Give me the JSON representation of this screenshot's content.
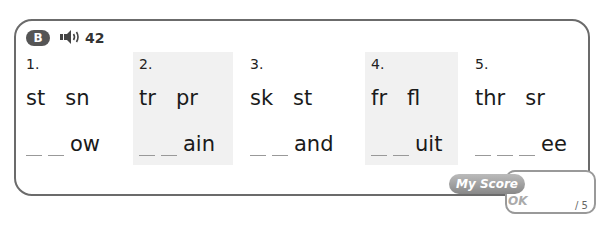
{
  "header": {
    "section_badge": "B",
    "audio_icon": "speaker-icon",
    "track_number": "42"
  },
  "items": [
    {
      "number": "1.",
      "options": [
        "st",
        "sn"
      ],
      "blanks": 2,
      "suffix": "ow",
      "shaded": false
    },
    {
      "number": "2.",
      "options": [
        "tr",
        "pr"
      ],
      "blanks": 2,
      "suffix": "ain",
      "shaded": true
    },
    {
      "number": "3.",
      "options": [
        "sk",
        "st"
      ],
      "blanks": 2,
      "suffix": "and",
      "shaded": false
    },
    {
      "number": "4.",
      "options": [
        "fr",
        "fl"
      ],
      "blanks": 2,
      "suffix": "uit",
      "shaded": true
    },
    {
      "number": "5.",
      "options": [
        "thr",
        "sr"
      ],
      "blanks": 3,
      "suffix": "ee",
      "shaded": false
    }
  ],
  "score": {
    "label": "My Score",
    "ok_label": "OK",
    "total": "/ 5"
  }
}
